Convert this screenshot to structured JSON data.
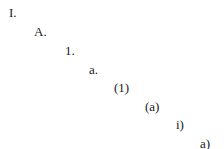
{
  "outline": {
    "levels": [
      {
        "label": "I.",
        "x": 9,
        "y": 6
      },
      {
        "label": "A.",
        "x": 34,
        "y": 25
      },
      {
        "label": "1.",
        "x": 65,
        "y": 44
      },
      {
        "label": "a.",
        "x": 89,
        "y": 63
      },
      {
        "label": "(1)",
        "x": 114,
        "y": 81
      },
      {
        "label": "(a)",
        "x": 145,
        "y": 100
      },
      {
        "label": "i)",
        "x": 176,
        "y": 118
      },
      {
        "label": "a)",
        "x": 200,
        "y": 137
      }
    ]
  }
}
